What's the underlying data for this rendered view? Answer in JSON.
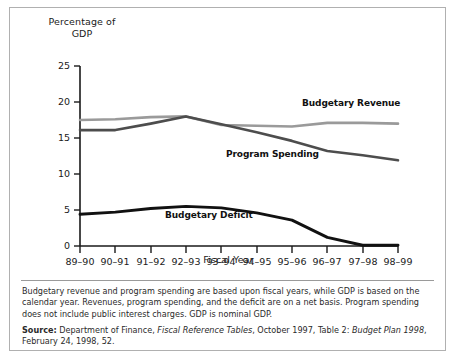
{
  "figure": {
    "y_axis_title_line1": "Percentage of",
    "y_axis_title_line2": "GDP",
    "x_axis_title": "Fiscal Year"
  },
  "notes": {
    "text": "Budgetary revenue and program spending are based upon fiscal years, while GDP is based on the calendar year. Revenues, program spending, and the deficit are on a net basis. Program spending does not include public interest charges. GDP is nominal GDP."
  },
  "source": {
    "lead": "Source:",
    "part1": " Department of Finance, ",
    "italic1": "Fiscal Reference Tables",
    "part2": ", October 1997, Table 2: ",
    "italic2": "Budget Plan 1998",
    "part3": ", February 24, 1998, 52."
  },
  "colors": {
    "budgetary_revenue": "#9a9a9a",
    "program_spending": "#4d4d4d",
    "budgetary_deficit": "#111111",
    "axis": "#1a1a1a",
    "frame": "#b0b0b0"
  },
  "chart_data": {
    "type": "line",
    "title": "",
    "xlabel": "Fiscal Year",
    "ylabel": "Percentage of GDP",
    "ylim": [
      0,
      25
    ],
    "yticks": [
      0,
      5,
      10,
      15,
      20,
      25
    ],
    "grid": false,
    "legend": "inline-labels",
    "categories": [
      "89–90",
      "90–91",
      "91–92",
      "92–93",
      "93–94",
      "94–95",
      "95–96",
      "96–97",
      "97–98",
      "98–99"
    ],
    "series": [
      {
        "name": "Budgetary Revenue",
        "color": "#9a9a9a",
        "values": [
          17.5,
          17.6,
          17.9,
          18.0,
          16.8,
          16.7,
          16.6,
          17.1,
          17.1,
          17.0
        ]
      },
      {
        "name": "Program Spending",
        "color": "#4d4d4d",
        "values": [
          16.1,
          16.1,
          17.0,
          18.0,
          16.9,
          15.8,
          14.6,
          13.2,
          12.6,
          11.9
        ]
      },
      {
        "name": "Budgetary Deficit",
        "color": "#111111",
        "values": [
          4.4,
          4.7,
          5.2,
          5.5,
          5.3,
          4.6,
          3.6,
          1.2,
          0.1,
          0.1
        ]
      }
    ],
    "annotations": [
      {
        "label": "Budgetary Revenue",
        "near_category": "96–97"
      },
      {
        "label": "Program Spending",
        "near_category": "94–95"
      },
      {
        "label": "Budgetary Deficit",
        "near_category": "93–94"
      }
    ]
  }
}
